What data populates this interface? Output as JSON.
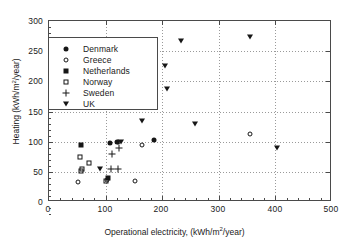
{
  "chart_data": {
    "type": "scatter",
    "title": "",
    "xlabel": "Operational electricity, (kWh/m2/year)",
    "ylabel": "Heating (kWh/m2/year)",
    "xlim": [
      0,
      500
    ],
    "ylim": [
      0,
      300
    ],
    "xticks": [
      0,
      100,
      200,
      300,
      400,
      500
    ],
    "yticks": [
      0,
      50,
      100,
      150,
      200,
      250,
      300
    ],
    "xtick_labels": [
      "0",
      "100",
      "200",
      "300",
      "400",
      "500"
    ],
    "ytick_labels": [
      "0",
      "50",
      "100",
      "150",
      "200",
      "250",
      "300"
    ],
    "grid": true,
    "legend_position": "upper left",
    "series": [
      {
        "name": "Denmark",
        "marker": "filled-circle",
        "color": "#161616",
        "points": [
          {
            "x": 108,
            "y": 98
          },
          {
            "x": 120,
            "y": 99
          },
          {
            "x": 185,
            "y": 103
          }
        ]
      },
      {
        "name": "Greece",
        "marker": "open-circle",
        "color": "#161616",
        "points": [
          {
            "x": 52,
            "y": 33
          },
          {
            "x": 102,
            "y": 36
          },
          {
            "x": 122,
            "y": 100
          },
          {
            "x": 152,
            "y": 35
          },
          {
            "x": 165,
            "y": 95
          },
          {
            "x": 356,
            "y": 112
          }
        ]
      },
      {
        "name": "Netherlands",
        "marker": "filled-square",
        "color": "#161616",
        "points": [
          {
            "x": 57,
            "y": 95
          },
          {
            "x": 105,
            "y": 40
          }
        ]
      },
      {
        "name": "Norway",
        "marker": "open-square",
        "color": "#161616",
        "points": [
          {
            "x": 55,
            "y": 75
          },
          {
            "x": 56,
            "y": 51
          },
          {
            "x": 70,
            "y": 64
          },
          {
            "x": 58,
            "y": 54
          },
          {
            "x": 100,
            "y": 35
          }
        ]
      },
      {
        "name": "Sweden",
        "marker": "plus",
        "color": "#161616",
        "points": [
          {
            "x": 112,
            "y": 80
          },
          {
            "x": 124,
            "y": 90
          },
          {
            "x": 110,
            "y": 55
          },
          {
            "x": 122,
            "y": 55
          }
        ]
      },
      {
        "name": "UK",
        "marker": "triangle-down",
        "color": "#161616",
        "points": [
          {
            "x": 90,
            "y": 55
          },
          {
            "x": 128,
            "y": 100
          },
          {
            "x": 164,
            "y": 135
          },
          {
            "x": 205,
            "y": 225
          },
          {
            "x": 209,
            "y": 187
          },
          {
            "x": 234,
            "y": 267
          },
          {
            "x": 258,
            "y": 130
          },
          {
            "x": 356,
            "y": 273
          },
          {
            "x": 403,
            "y": 89
          }
        ]
      }
    ]
  },
  "axes": {
    "xlabel_prefix": "Operational electricity, (kWh/m",
    "xlabel_sup": "2",
    "xlabel_suffix": "/year)",
    "ylabel_prefix": "Heating (kWh/m",
    "ylabel_sup": "2",
    "ylabel_suffix": "/year)"
  }
}
